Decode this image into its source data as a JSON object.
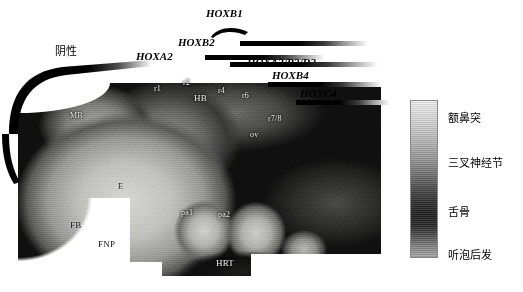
{
  "negative_label": "阴性",
  "gene_tracks": [
    {
      "id": "hoxb1",
      "name": "HOXB1",
      "marker": "arc"
    },
    {
      "id": "hoxb2",
      "name": "HOXB2",
      "marker": "bar"
    },
    {
      "id": "hoxa2",
      "name": "HOXA2",
      "marker": "bar"
    },
    {
      "id": "hoxa3b3d3",
      "name": "HOXA3/B3/D3",
      "marker": "bar"
    },
    {
      "id": "hoxb4",
      "name": "HOXB4",
      "marker": "bar"
    },
    {
      "id": "hoxc4",
      "name": "HOXC4",
      "marker": "bar"
    }
  ],
  "embryo_labels": [
    {
      "id": "mb",
      "text": "MB"
    },
    {
      "id": "r1",
      "text": "r1"
    },
    {
      "id": "r2",
      "text": "r2"
    },
    {
      "id": "hb",
      "text": "HB"
    },
    {
      "id": "r4",
      "text": "r4"
    },
    {
      "id": "r6",
      "text": "r6"
    },
    {
      "id": "r78",
      "text": "r7/8"
    },
    {
      "id": "ov",
      "text": "ov"
    },
    {
      "id": "e",
      "text": "E"
    },
    {
      "id": "fb",
      "text": "FB"
    },
    {
      "id": "fnp",
      "text": "FNP"
    },
    {
      "id": "pa1",
      "text": "pa1"
    },
    {
      "id": "pa2",
      "text": "pa2"
    },
    {
      "id": "hrt",
      "text": "HRT"
    }
  ],
  "legend": {
    "items": [
      {
        "id": "frontonasal",
        "text": "额鼻突"
      },
      {
        "id": "trigeminal",
        "text": "三叉神经节"
      },
      {
        "id": "hyoid",
        "text": "舌骨"
      },
      {
        "id": "post-otic",
        "text": "听泡后发"
      }
    ],
    "gradient_top_color": "#efefef",
    "gradient_mid_color": "#222222",
    "gradient_bottom_color": "#a5a5a5"
  },
  "colors": {
    "background": "#ffffff",
    "bar_dark": "#000000",
    "text": "#000000"
  }
}
